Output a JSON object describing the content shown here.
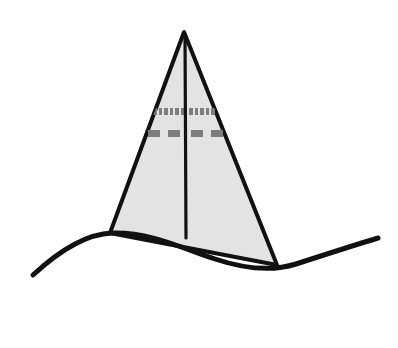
{
  "canvas": {
    "width": 398,
    "height": 348,
    "background_color": "#ffffff",
    "title": "Triangular sail over wavy ground line"
  },
  "style": {
    "stroke_color": "#111111",
    "fill_color": "#e3e3e3",
    "dash_color": "#7d7d7d",
    "outline_width": 4,
    "mast_width": 3.2,
    "ground_width": 5
  },
  "shapes": {
    "triangle": {
      "name": "sail-triangle",
      "apex": {
        "x": 184,
        "y": 32
      },
      "bottom_left": {
        "x": 110,
        "y": 233
      },
      "bottom_right": {
        "x": 277,
        "y": 265
      },
      "path": "M 184 32 L 110 233 L 277 265 Z",
      "fill": "#e3e3e3",
      "stroke": "#111111"
    },
    "mast": {
      "name": "center-mast-line",
      "x1": 185,
      "y1": 34,
      "x2": 186,
      "y2": 238,
      "stroke": "#111111"
    },
    "ground": {
      "name": "wavy-ground-line",
      "path": "M 33 275 C 60 250 86 234 112 233 C 150 232 182 248 215 259 C 248 270 274 271 296 264 C 330 253 358 244 378 238",
      "stroke": "#111111",
      "start": {
        "x": 33,
        "y": 275
      },
      "end": {
        "x": 378,
        "y": 238
      }
    }
  },
  "dash_rows": [
    {
      "name": "upper-dash-row",
      "y": 108,
      "height": 7,
      "color": "#7d7d7d",
      "dashes": [
        {
          "x": 153,
          "width": 4
        },
        {
          "x": 159,
          "width": 3
        },
        {
          "x": 164,
          "width": 4
        },
        {
          "x": 170,
          "width": 3
        },
        {
          "x": 175,
          "width": 4
        },
        {
          "x": 181,
          "width": 3
        },
        {
          "x": 189,
          "width": 4
        },
        {
          "x": 195,
          "width": 3
        },
        {
          "x": 200,
          "width": 4
        },
        {
          "x": 206,
          "width": 3
        },
        {
          "x": 211,
          "width": 4
        },
        {
          "x": 217,
          "width": 3
        }
      ]
    },
    {
      "name": "lower-dash-row",
      "y": 130,
      "height": 7,
      "color": "#7d7d7d",
      "dashes": [
        {
          "x": 148,
          "width": 12
        },
        {
          "x": 168,
          "width": 12
        },
        {
          "x": 191,
          "width": 12
        },
        {
          "x": 211,
          "width": 12
        }
      ]
    }
  ]
}
